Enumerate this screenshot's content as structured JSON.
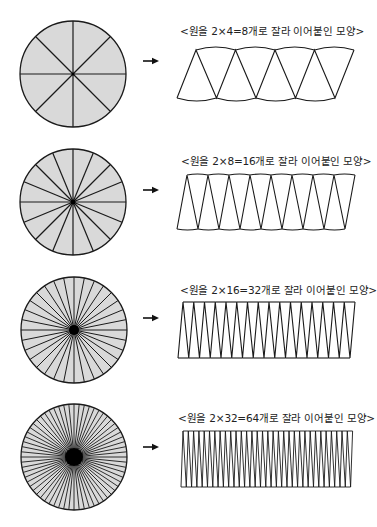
{
  "colors": {
    "circle_fill": "#d9d9d9",
    "stroke": "#1a1a1a",
    "arrow": "#111111",
    "background": "#ffffff"
  },
  "rows": [
    {
      "slices": 8,
      "label": "<원을 2×4=8개로 잘라 이어붙인 모양>",
      "circle": {
        "cx": 73,
        "cy": 74,
        "r": 53
      },
      "label_pos": {
        "x": 180,
        "y": 23
      },
      "arrow": {
        "x": 143,
        "y": 61
      },
      "strip": {
        "top_y": 50,
        "bottom_y": 98,
        "top_x0": 196,
        "bottom_x0": 177,
        "period": 39.5,
        "arc_sag": 6
      }
    },
    {
      "slices": 16,
      "label": "<원을 2×8=16개로 잘라 이어붙인 모양>",
      "circle": {
        "cx": 73,
        "cy": 202,
        "r": 53
      },
      "label_pos": {
        "x": 181,
        "y": 153
      },
      "arrow": {
        "x": 143,
        "y": 190
      },
      "strip": {
        "top_y": 175,
        "bottom_y": 229,
        "top_x0": 187,
        "bottom_x0": 177,
        "period": 21,
        "arc_sag": 2
      }
    },
    {
      "slices": 32,
      "label": "<원을 2×16=32개로 잘라 이어붙인 모양>",
      "circle": {
        "cx": 74,
        "cy": 330,
        "r": 53
      },
      "label_pos": {
        "x": 180,
        "y": 282
      },
      "arrow": {
        "x": 143,
        "y": 318
      },
      "strip": {
        "top_y": 302,
        "bottom_y": 358,
        "top_x0": 183,
        "bottom_x0": 178,
        "period": 10.75,
        "arc_sag": 0
      }
    },
    {
      "slices": 64,
      "label": "<원을 2×32=64개로 잘라 이어붙인 모양>",
      "circle": {
        "cx": 74,
        "cy": 457,
        "r": 53
      },
      "label_pos": {
        "x": 178,
        "y": 410
      },
      "arrow": {
        "x": 143,
        "y": 447
      },
      "strip": {
        "top_y": 431,
        "bottom_y": 487,
        "top_x0": 183,
        "bottom_x0": 181,
        "period": 5.3,
        "arc_sag": 0
      }
    }
  ]
}
